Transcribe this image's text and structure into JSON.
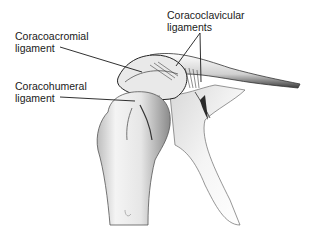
{
  "diagram": {
    "labels": [
      {
        "id": "coracoacromial",
        "line1": "Coracoacromial",
        "line2": "ligament"
      },
      {
        "id": "coracohumeral",
        "line1": "Coracohumeral",
        "line2": "ligament"
      },
      {
        "id": "coracoclavicular",
        "line1": "Coracoclavicular",
        "line2": "ligaments"
      }
    ],
    "colors": {
      "background": "#ffffff",
      "ink": "#1a1a1a",
      "bone_light": "#f2f2f2",
      "bone_shade": "#9a9a9a"
    }
  }
}
